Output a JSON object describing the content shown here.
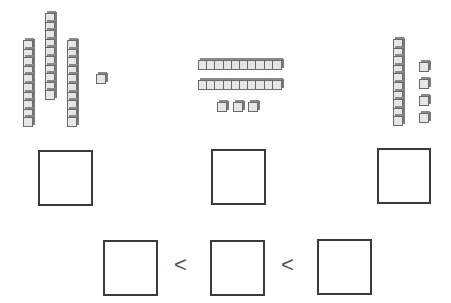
{
  "task": "Count base-ten blocks, write each number, then order from least to greatest",
  "groups": [
    {
      "id": "group-a",
      "tens": 3,
      "ones": 1,
      "orientation": "vertical"
    },
    {
      "id": "group-b",
      "tens": 2,
      "ones": 3,
      "orientation": "horizontal"
    },
    {
      "id": "group-c",
      "tens": 1,
      "ones": 4,
      "orientation": "vertical"
    }
  ],
  "answer_boxes": [
    "",
    "",
    ""
  ],
  "ordering": {
    "boxes": [
      "",
      "",
      ""
    ],
    "comparators": [
      "<",
      "<"
    ]
  },
  "colors": {
    "cube_fill": "#e6e6e6",
    "cube_edge": "#6a6a6a",
    "box_border": "#3a3a3a"
  }
}
